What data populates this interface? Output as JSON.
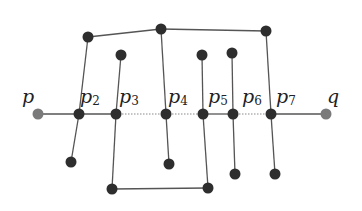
{
  "diagram": {
    "colors": {
      "node": "#2e2e2e",
      "endpoint": "#7a7a7a",
      "edge": "#555555",
      "dotted": "#8a8a8a"
    },
    "labels": [
      {
        "id": "p",
        "base": "p",
        "sub": "",
        "x": 22,
        "y": 103
      },
      {
        "id": "p2",
        "base": "p",
        "sub": "2",
        "x": 80,
        "y": 103
      },
      {
        "id": "p3",
        "base": "p",
        "sub": "3",
        "x": 119,
        "y": 103
      },
      {
        "id": "p4",
        "base": "p",
        "sub": "4",
        "x": 168,
        "y": 103
      },
      {
        "id": "p5",
        "base": "p",
        "sub": "5",
        "x": 208,
        "y": 103
      },
      {
        "id": "p6",
        "base": "p",
        "sub": "6",
        "x": 242,
        "y": 103
      },
      {
        "id": "p7",
        "base": "p",
        "sub": "7",
        "x": 276,
        "y": 103
      },
      {
        "id": "q",
        "base": "q",
        "sub": "",
        "x": 327,
        "y": 103
      }
    ],
    "path_nodes": [
      {
        "id": "p",
        "x": 38,
        "y": 114,
        "type": "endpoint"
      },
      {
        "id": "p2",
        "x": 79,
        "y": 114,
        "type": "node"
      },
      {
        "id": "p3",
        "x": 116,
        "y": 114,
        "type": "node"
      },
      {
        "id": "p4",
        "x": 166,
        "y": 114,
        "type": "node"
      },
      {
        "id": "p5",
        "x": 203,
        "y": 114,
        "type": "node"
      },
      {
        "id": "p6",
        "x": 233,
        "y": 114,
        "type": "node"
      },
      {
        "id": "p7",
        "x": 271,
        "y": 114,
        "type": "node"
      },
      {
        "id": "q",
        "x": 326,
        "y": 114,
        "type": "endpoint"
      }
    ],
    "path_segments": [
      {
        "from": "p",
        "to": "p2",
        "style": "solid"
      },
      {
        "from": "p2",
        "to": "p3",
        "style": "solid"
      },
      {
        "from": "p3",
        "to": "p4",
        "style": "dotted"
      },
      {
        "from": "p4",
        "to": "p5",
        "style": "dotted"
      },
      {
        "from": "p5",
        "to": "p6",
        "style": "solid"
      },
      {
        "from": "p6",
        "to": "p7",
        "style": "dotted"
      },
      {
        "from": "p7",
        "to": "q",
        "style": "solid"
      }
    ],
    "other_nodes": [
      {
        "id": "a",
        "x": 88,
        "y": 37
      },
      {
        "id": "b",
        "x": 161,
        "y": 29
      },
      {
        "id": "c",
        "x": 266,
        "y": 31
      },
      {
        "id": "d",
        "x": 121,
        "y": 55
      },
      {
        "id": "e",
        "x": 202,
        "y": 55
      },
      {
        "id": "f",
        "x": 232,
        "y": 53
      },
      {
        "id": "g",
        "x": 71,
        "y": 162
      },
      {
        "id": "h",
        "x": 169,
        "y": 164
      },
      {
        "id": "i",
        "x": 112,
        "y": 189
      },
      {
        "id": "j",
        "x": 208,
        "y": 188
      },
      {
        "id": "k",
        "x": 235,
        "y": 174
      },
      {
        "id": "l",
        "x": 275,
        "y": 174
      }
    ],
    "edges": [
      {
        "from": "a",
        "to": "p2"
      },
      {
        "from": "p2",
        "to": "g"
      },
      {
        "from": "a",
        "to": "b"
      },
      {
        "from": "b",
        "to": "c"
      },
      {
        "from": "b",
        "to": "p4"
      },
      {
        "from": "p4",
        "to": "h"
      },
      {
        "from": "c",
        "to": "p7"
      },
      {
        "from": "p7",
        "to": "l"
      },
      {
        "from": "d",
        "to": "p3"
      },
      {
        "from": "p3",
        "to": "i"
      },
      {
        "from": "i",
        "to": "j"
      },
      {
        "from": "j",
        "to": "p5"
      },
      {
        "from": "p5",
        "to": "e"
      },
      {
        "from": "f",
        "to": "p6"
      },
      {
        "from": "p6",
        "to": "k"
      }
    ]
  }
}
